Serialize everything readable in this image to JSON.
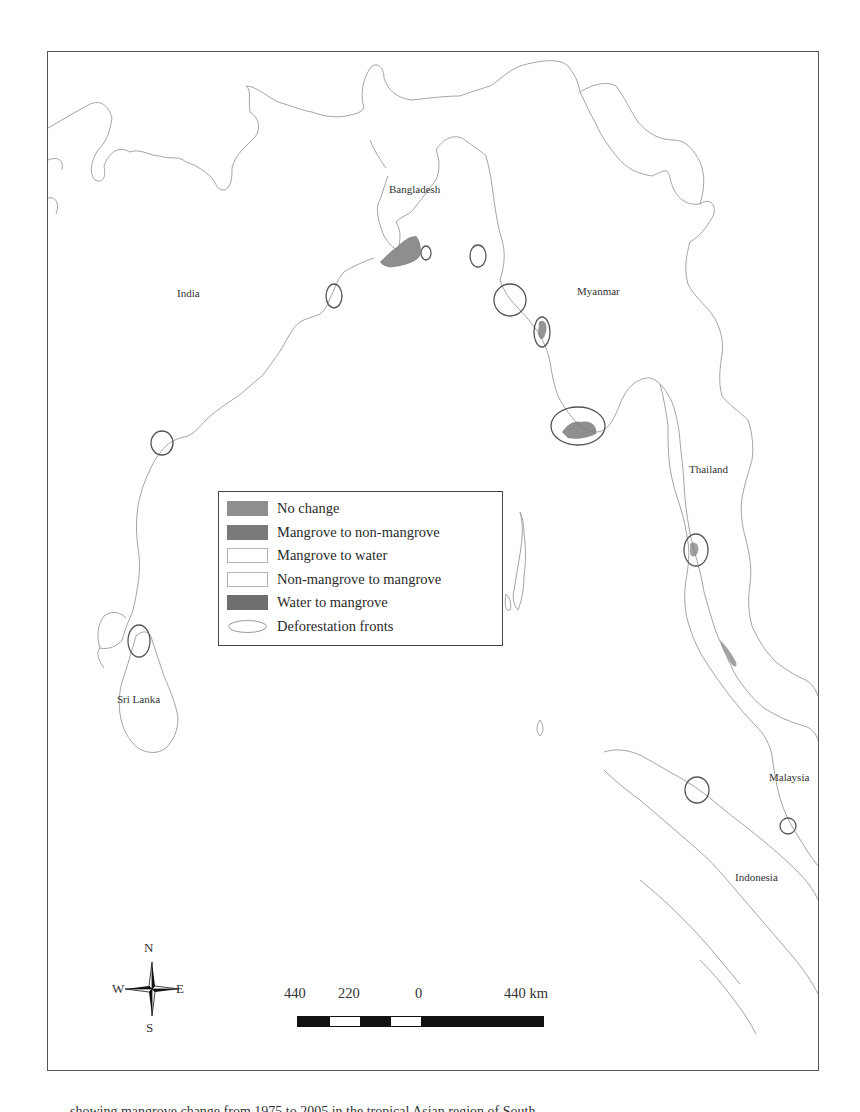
{
  "map": {
    "country_labels": [
      {
        "name": "Bangladesh",
        "x": 389,
        "y": 183
      },
      {
        "name": "India",
        "x": 177,
        "y": 287
      },
      {
        "name": "Myanmar",
        "x": 577,
        "y": 285
      },
      {
        "name": "Thailand",
        "x": 689,
        "y": 463
      },
      {
        "name": "Sri Lanka",
        "x": 117,
        "y": 693
      },
      {
        "name": "Malaysia",
        "x": 769,
        "y": 771
      },
      {
        "name": "Indonesia",
        "x": 735,
        "y": 871
      }
    ],
    "deforestation_fronts": [
      {
        "cx": 426,
        "cy": 253,
        "rx": 5,
        "ry": 7
      },
      {
        "cx": 478,
        "cy": 256,
        "rx": 8,
        "ry": 11
      },
      {
        "cx": 334,
        "cy": 296,
        "rx": 8,
        "ry": 12
      },
      {
        "cx": 510,
        "cy": 300,
        "rx": 16,
        "ry": 16
      },
      {
        "cx": 542,
        "cy": 332,
        "rx": 8,
        "ry": 15
      },
      {
        "cx": 578,
        "cy": 426,
        "rx": 27,
        "ry": 19
      },
      {
        "cx": 162,
        "cy": 443,
        "rx": 11,
        "ry": 12
      },
      {
        "cx": 696,
        "cy": 550,
        "rx": 12,
        "ry": 16
      },
      {
        "cx": 139,
        "cy": 641,
        "rx": 11,
        "ry": 16
      },
      {
        "cx": 697,
        "cy": 790,
        "rx": 12,
        "ry": 13
      },
      {
        "cx": 788,
        "cy": 826,
        "rx": 8,
        "ry": 8
      }
    ]
  },
  "legend": {
    "items": [
      {
        "label": "No change",
        "color": "#8e8e8e",
        "border": "#8e8e8e"
      },
      {
        "label": "Mangrove to non-mangrove",
        "color": "#7a7a7a",
        "border": "#7a7a7a"
      },
      {
        "label": "Mangrove to water",
        "color": "#ffffff",
        "border": "#b5b5b5"
      },
      {
        "label": "Non-mangrove to mangrove",
        "color": "#ffffff",
        "border": "#b5b5b5"
      },
      {
        "label": "Water to mangrove",
        "color": "#6f6f6f",
        "border": "#6f6f6f"
      }
    ],
    "fronts_label": "Deforestation fronts"
  },
  "scale_bar": {
    "labels": [
      "440",
      "220",
      "0",
      "440 km"
    ],
    "segments": [
      "#111111",
      "#ffffff",
      "#111111",
      "#ffffff",
      "#111111"
    ]
  },
  "compass": {
    "n": "N",
    "s": "S",
    "e": "E",
    "w": "W"
  },
  "caption": {
    "text": "showing mangrove change from 1975 to 2005 in the tropical Asian region of South..."
  }
}
